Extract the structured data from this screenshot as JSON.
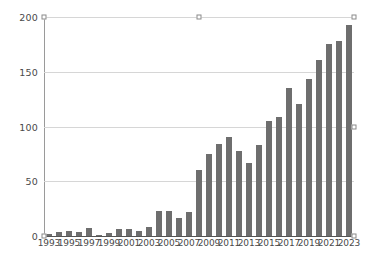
{
  "chart_data": {
    "type": "bar",
    "title": "",
    "subtitle": "",
    "xlabel": "",
    "ylabel": "",
    "ylim": [
      0,
      200
    ],
    "y_ticks": [
      0,
      50,
      100,
      150,
      200
    ],
    "grid": true,
    "legend": null,
    "x_tick_labels": [
      "1993",
      "1995",
      "1997",
      "1999",
      "2001",
      "2003",
      "2005",
      "2007",
      "2009",
      "2011",
      "2013",
      "2015",
      "2017",
      "2019",
      "2021",
      "2023"
    ],
    "categories": [
      "1993",
      "1994",
      "1995",
      "1996",
      "1997",
      "1998",
      "1999",
      "2000",
      "2001",
      "2002",
      "2003",
      "2004",
      "2005",
      "2006",
      "2007",
      "2008",
      "2009",
      "2010",
      "2011",
      "2012",
      "2013",
      "2014",
      "2015",
      "2016",
      "2017",
      "2018",
      "2019",
      "2020",
      "2021",
      "2022",
      "2023"
    ],
    "values": [
      2,
      4,
      5,
      4,
      7,
      1,
      3,
      6,
      6,
      5,
      8,
      23,
      23,
      16,
      22,
      60,
      75,
      84,
      90,
      78,
      67,
      83,
      105,
      109,
      135,
      121,
      143,
      161,
      175,
      178,
      193
    ],
    "bar_color": "#6e6e6e",
    "gridline_color": "#d6d6d6",
    "axis_color": "#9a9a9a",
    "baseline_color": "#555555",
    "background_color": "#ffffff"
  },
  "selection": {
    "handle_color": "#8a8a8a",
    "handle_fill": "#ffffff",
    "handles": [
      {
        "name": "handle-top-left",
        "x": 0,
        "y": 0
      },
      {
        "name": "handle-top-center",
        "x": 50,
        "y": 0
      },
      {
        "name": "handle-top-right",
        "x": 100,
        "y": 0
      },
      {
        "name": "handle-middle-right",
        "x": 100,
        "y": 50
      },
      {
        "name": "handle-bottom-left",
        "x": 0,
        "y": 100
      },
      {
        "name": "handle-bottom-right",
        "x": 100,
        "y": 100
      }
    ]
  }
}
